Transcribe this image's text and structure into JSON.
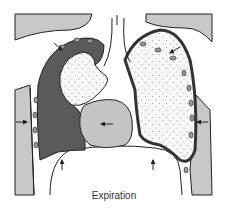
{
  "caption": "Expiration",
  "colors": {
    "background": "#ffffff",
    "outline": "#222222",
    "light_gray": "#c8c8c8",
    "collapsed_lung": "#5a5a5a",
    "lung_fill": "#f7f7f7",
    "heart": "#c4c4c4",
    "rib": "#9a9a9a"
  },
  "parts": [
    "shoulder-left",
    "shoulder-right",
    "chest-wall-left",
    "chest-wall-right",
    "trachea",
    "collapsed-lung-left",
    "lung-left-inner",
    "lung-right",
    "heart",
    "diaphragm"
  ],
  "arrows": [
    "arrow-up-trachea",
    "arrow-in-left",
    "arrow-in-right",
    "arrow-up-diaphragm-left",
    "arrow-up-diaphragm-right",
    "arrow-shoulder-left",
    "arrow-shoulder-right",
    "arrow-heart-left"
  ]
}
